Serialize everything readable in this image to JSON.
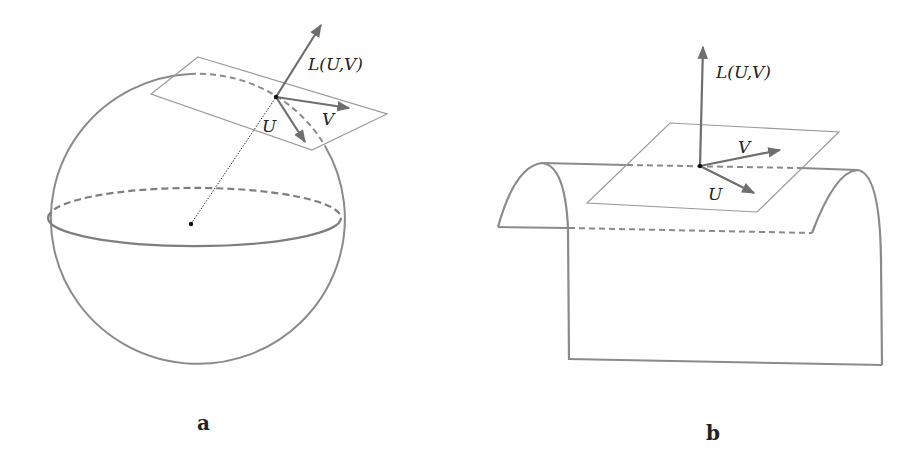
{
  "figure": {
    "panels": [
      {
        "id": "a",
        "caption": "a",
        "surface": "sphere",
        "labels": {
          "normal": "L(U,V)",
          "u": "U",
          "v": "V"
        }
      },
      {
        "id": "b",
        "caption": "b",
        "surface": "cylinder",
        "labels": {
          "normal": "L(U,V)",
          "u": "U",
          "v": "V"
        }
      }
    ],
    "colors": {
      "stroke": "#8a8a8a",
      "arrow": "#6e6e6e",
      "plane": "#9a9a9a",
      "point": "#111111",
      "text": "#222222"
    }
  }
}
